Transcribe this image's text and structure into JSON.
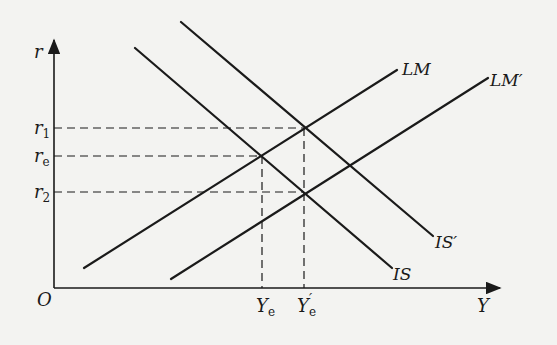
{
  "diagram": {
    "type": "IS-LM shift diagram",
    "axes": {
      "y_label": "r",
      "x_label": "Y",
      "origin_label": "O"
    },
    "y_ticks": [
      {
        "id": "r1",
        "main": "r",
        "sub": "1"
      },
      {
        "id": "re",
        "main": "r",
        "sub": "e"
      },
      {
        "id": "r2",
        "main": "r",
        "sub": "2"
      }
    ],
    "x_ticks": [
      {
        "id": "Ye",
        "main": "Y",
        "sub": "e",
        "prime": ""
      },
      {
        "id": "Ye_prime",
        "main": "Y",
        "sub": "e",
        "prime": "′"
      }
    ],
    "curves": [
      {
        "id": "LM",
        "label": "LM"
      },
      {
        "id": "LM_prime",
        "label": "LM′"
      },
      {
        "id": "IS",
        "label": "IS"
      },
      {
        "id": "IS_prime",
        "label": "IS′"
      }
    ],
    "colors": {
      "ink": "#1a1a1a",
      "paper": "#f3f3f1"
    }
  }
}
